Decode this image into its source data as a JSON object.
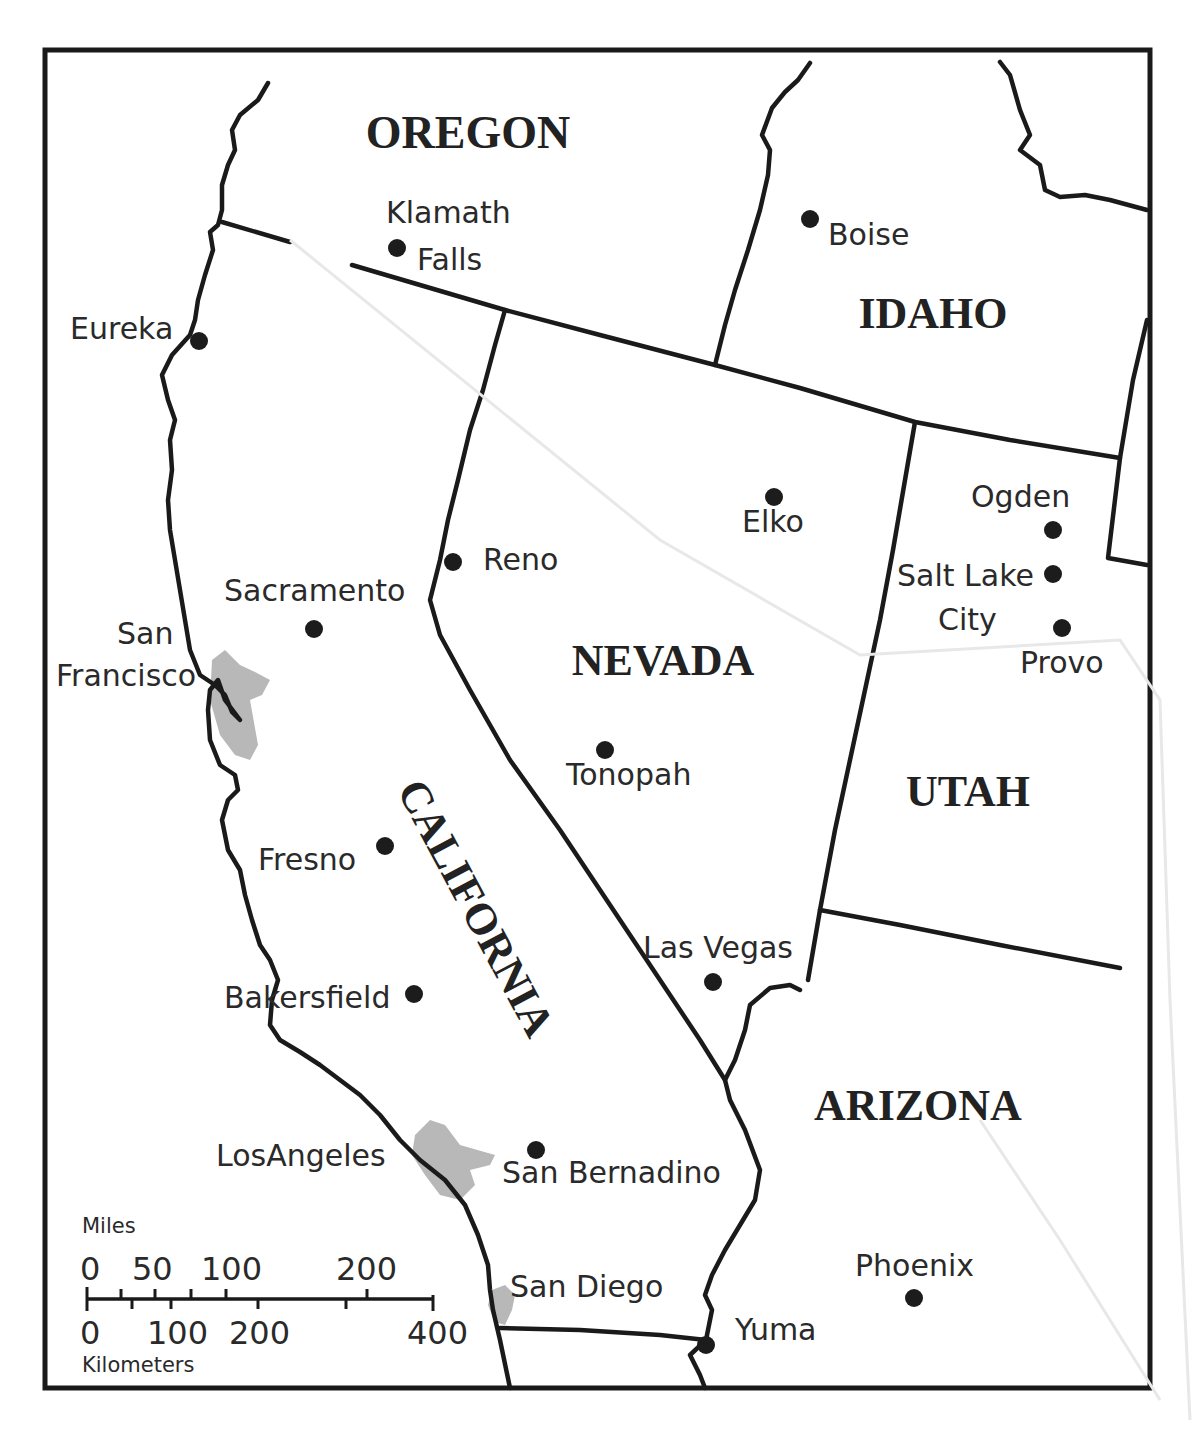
{
  "map": {
    "states": [
      {
        "name": "OREGON",
        "x": 468,
        "y": 148
      },
      {
        "name": "IDAHO",
        "x": 933,
        "y": 328
      },
      {
        "name": "NEVADA",
        "x": 663,
        "y": 675
      },
      {
        "name": "UTAH",
        "x": 968,
        "y": 806
      },
      {
        "name": "ARIZONA",
        "x": 918,
        "y": 1120
      },
      {
        "name": "CALIFORNIA",
        "x": 463,
        "y": 915,
        "rotate": 62
      }
    ],
    "cities": [
      {
        "name": "Klamath",
        "name2": "Falls",
        "dot": [
          397,
          248
        ]
      },
      {
        "name": "Boise",
        "dot": [
          810,
          219
        ]
      },
      {
        "name": "Eureka",
        "dot": [
          199,
          341
        ]
      },
      {
        "name": "Elko",
        "dot": [
          774,
          497
        ]
      },
      {
        "name": "Ogden",
        "dot": [
          1053,
          530
        ]
      },
      {
        "name": "Salt Lake",
        "name2": "City",
        "dot": [
          1053,
          574
        ]
      },
      {
        "name": "Provo",
        "dot": [
          1062,
          628
        ]
      },
      {
        "name": "Reno",
        "dot": [
          453,
          562
        ]
      },
      {
        "name": "Sacramento",
        "dot": [
          314,
          629
        ]
      },
      {
        "name": "San",
        "name2": "Francisco",
        "dot": [
          212,
          680
        ]
      },
      {
        "name": "Tonopah",
        "dot": [
          605,
          750
        ]
      },
      {
        "name": "Fresno",
        "dot": [
          385,
          846
        ]
      },
      {
        "name": "Las Vegas",
        "dot": [
          713,
          982
        ]
      },
      {
        "name": "Bakersfield",
        "dot": [
          414,
          994
        ]
      },
      {
        "name": "LosAngeles",
        "dot": [
          411,
          1150
        ]
      },
      {
        "name": "San Bernadino",
        "dot": [
          536,
          1150
        ]
      },
      {
        "name": "San Diego",
        "dot": [
          497,
          1300
        ]
      },
      {
        "name": "Yuma",
        "dot": [
          706,
          1345
        ]
      },
      {
        "name": "Phoenix",
        "dot": [
          914,
          1298
        ]
      }
    ],
    "scale_bar": {
      "miles_label": "Miles",
      "miles_ticks": [
        "0",
        "50",
        "100",
        "200"
      ],
      "km_label": "Kilometers",
      "km_ticks": [
        "0",
        "100",
        "200",
        "400"
      ]
    },
    "colors": {
      "ink": "#1a1a1a",
      "metro_area": "#b8b8b8",
      "background": "#ffffff"
    }
  }
}
